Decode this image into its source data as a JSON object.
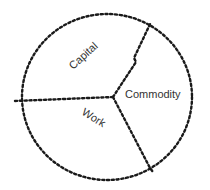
{
  "diagram": {
    "type": "pie-circle",
    "style": "hand-drawn dashed",
    "stroke_color": "#1a1a1a",
    "segments": [
      {
        "label": "Capital"
      },
      {
        "label": "Commodity"
      },
      {
        "label": "Work"
      }
    ]
  }
}
